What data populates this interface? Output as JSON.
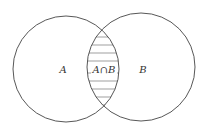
{
  "diagram": {
    "type": "venn",
    "sets": [
      {
        "name": "A",
        "label": "A",
        "cx": 66,
        "cy": 69,
        "r": 53
      },
      {
        "name": "B",
        "label": "B",
        "cx": 141,
        "cy": 67,
        "r": 54
      }
    ],
    "intersection": {
      "label": "A∩B",
      "fill": "horizontal-hatch"
    },
    "colors": {
      "stroke": "#444444",
      "hatch": "#666666",
      "background": "#ffffff"
    }
  }
}
